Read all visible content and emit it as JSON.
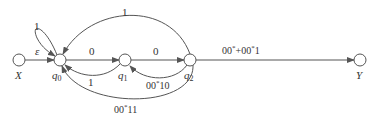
{
  "diagram": {
    "type": "state-transition-graph",
    "nodes": [
      {
        "id": "X",
        "label": "X",
        "italic": true
      },
      {
        "id": "q0",
        "label": "q",
        "sub": "0"
      },
      {
        "id": "q1",
        "label": "q",
        "sub": "1"
      },
      {
        "id": "q2",
        "label": "q",
        "sub": "2"
      },
      {
        "id": "Y",
        "label": "Y",
        "italic": true
      }
    ],
    "edges": [
      {
        "from": "X",
        "to": "q0",
        "label": "ε"
      },
      {
        "from": "q0",
        "to": "q0",
        "label": "1"
      },
      {
        "from": "q0",
        "to": "q1",
        "label": "0"
      },
      {
        "from": "q1",
        "to": "q0",
        "label": "1"
      },
      {
        "from": "q1",
        "to": "q2",
        "label": "0"
      },
      {
        "from": "q2",
        "to": "q1",
        "label": "00*10"
      },
      {
        "from": "q2",
        "to": "q0",
        "label": "1"
      },
      {
        "from": "q2",
        "to": "q0",
        "label": "00*11"
      },
      {
        "from": "q2",
        "to": "Y",
        "label": "00*+00*1"
      }
    ]
  },
  "labels": {
    "X": "X",
    "Y": "Y",
    "q0_base": "q",
    "q0_sub": "0",
    "q1_base": "q",
    "q1_sub": "1",
    "q2_base": "q",
    "q2_sub": "2",
    "eps": "ε",
    "self_loop": "1",
    "q0_q1": "0",
    "q1_q0": "1",
    "q1_q2": "0",
    "q2_q1_a": "00",
    "q2_q1_star": "*",
    "q2_q1_b": "10",
    "q2_q0_top": "1",
    "q2_q0_bot_a": "00",
    "q2_q0_bot_star": "*",
    "q2_q0_bot_b": "11",
    "q2_Y_a": "00",
    "q2_Y_star1": "*",
    "q2_Y_b": "+00",
    "q2_Y_star2": "*",
    "q2_Y_c": "1"
  }
}
